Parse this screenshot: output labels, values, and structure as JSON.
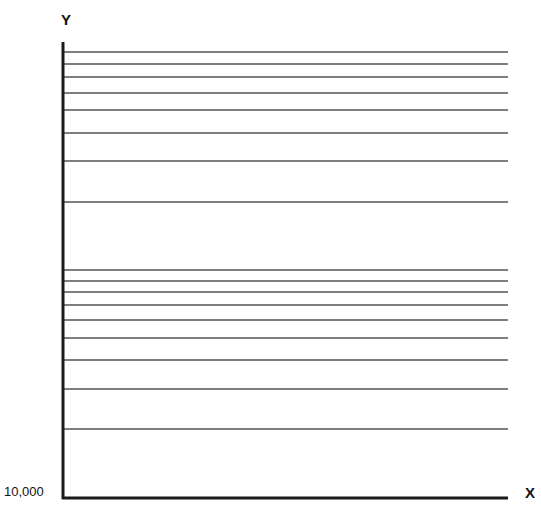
{
  "chart_data": {
    "type": "line",
    "title": "",
    "xlabel": "X",
    "ylabel": "Y",
    "y_scale": "log",
    "y_origin_label": "10,000",
    "y_tick_labels": [
      "10,000"
    ],
    "grid": true,
    "series": [],
    "gridline_pixel_y": [
      52,
      64,
      77,
      93,
      110,
      133,
      161,
      202,
      270,
      281,
      292,
      305,
      320,
      338,
      360,
      389,
      429
    ],
    "note": "Blank semi-logarithmic graph paper, two log cycles, no data plotted"
  },
  "axes": {
    "x_label": "X",
    "y_label": "Y",
    "origin_label": "10,000"
  },
  "colors": {
    "axis": "#1a1a1a",
    "grid": "#555555"
  }
}
